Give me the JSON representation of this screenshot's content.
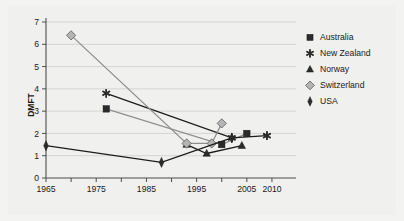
{
  "figure": {
    "background_color": "#f3f3f1",
    "plot_background_color": "#f3f3f1"
  },
  "chart_data": {
    "type": "line",
    "title": "",
    "xlabel": "",
    "ylabel": "DMFT",
    "xlim": [
      1965,
      2012
    ],
    "ylim": [
      0,
      7
    ],
    "grid": true,
    "grid_axis": "y",
    "legend_position": "right",
    "x_ticks": [
      1965,
      1975,
      1985,
      1995,
      2005,
      2010
    ],
    "x_tick_labels": [
      "1965",
      "1975",
      "1985",
      "1995",
      "2005",
      "2010"
    ],
    "x_minor_ticks": [
      1970,
      1980,
      1990,
      2000
    ],
    "y_ticks": [
      0,
      1,
      2,
      3,
      4,
      5,
      6,
      7
    ],
    "y_tick_labels": [
      "0",
      "1",
      "2",
      "3",
      "4",
      "5",
      "6",
      "7"
    ],
    "series": [
      {
        "name": "Australia",
        "marker": "square",
        "marker_style": "filled",
        "color": "#2b2b2b",
        "line_color": "#8f8f8f",
        "x": [
          1977,
          2000,
          2005
        ],
        "y": [
          3.1,
          1.5,
          2.0
        ]
      },
      {
        "name": "New Zealand",
        "marker": "asterisk",
        "marker_style": "filled",
        "color": "#2b2b2b",
        "line_color": "#1c1c1c",
        "x": [
          1977,
          2002,
          2009
        ],
        "y": [
          3.8,
          1.8,
          1.9
        ]
      },
      {
        "name": "Norway",
        "marker": "triangle",
        "marker_style": "filled",
        "color": "#2b2b2b",
        "line_color": "#1c1c1c",
        "x": [
          1993,
          1997,
          2004
        ],
        "y": [
          1.5,
          1.1,
          1.45
        ]
      },
      {
        "name": "Switzerland",
        "marker": "diamond",
        "marker_style": "open",
        "color": "#b5b5b5",
        "line_color": "#8f8f8f",
        "x": [
          1970,
          1993,
          1998,
          2000
        ],
        "y": [
          6.4,
          1.55,
          1.55,
          2.45
        ]
      },
      {
        "name": "USA",
        "marker": "vertical-diamond",
        "marker_style": "filled",
        "color": "#2b2b2b",
        "line_color": "#1c1c1c",
        "x": [
          1965,
          1988,
          2002
        ],
        "y": [
          1.45,
          0.7,
          1.8
        ]
      }
    ]
  },
  "legend": {
    "items": [
      {
        "label": "Australia",
        "marker": "square",
        "color": "#2b2b2b"
      },
      {
        "label": "New Zealand",
        "marker": "asterisk",
        "color": "#2b2b2b"
      },
      {
        "label": "Norway",
        "marker": "triangle",
        "color": "#2b2b2b"
      },
      {
        "label": "Switzerland",
        "marker": "diamond",
        "color": "#b5b5b5"
      },
      {
        "label": "USA",
        "marker": "vertical-diamond",
        "color": "#2b2b2b"
      }
    ]
  }
}
